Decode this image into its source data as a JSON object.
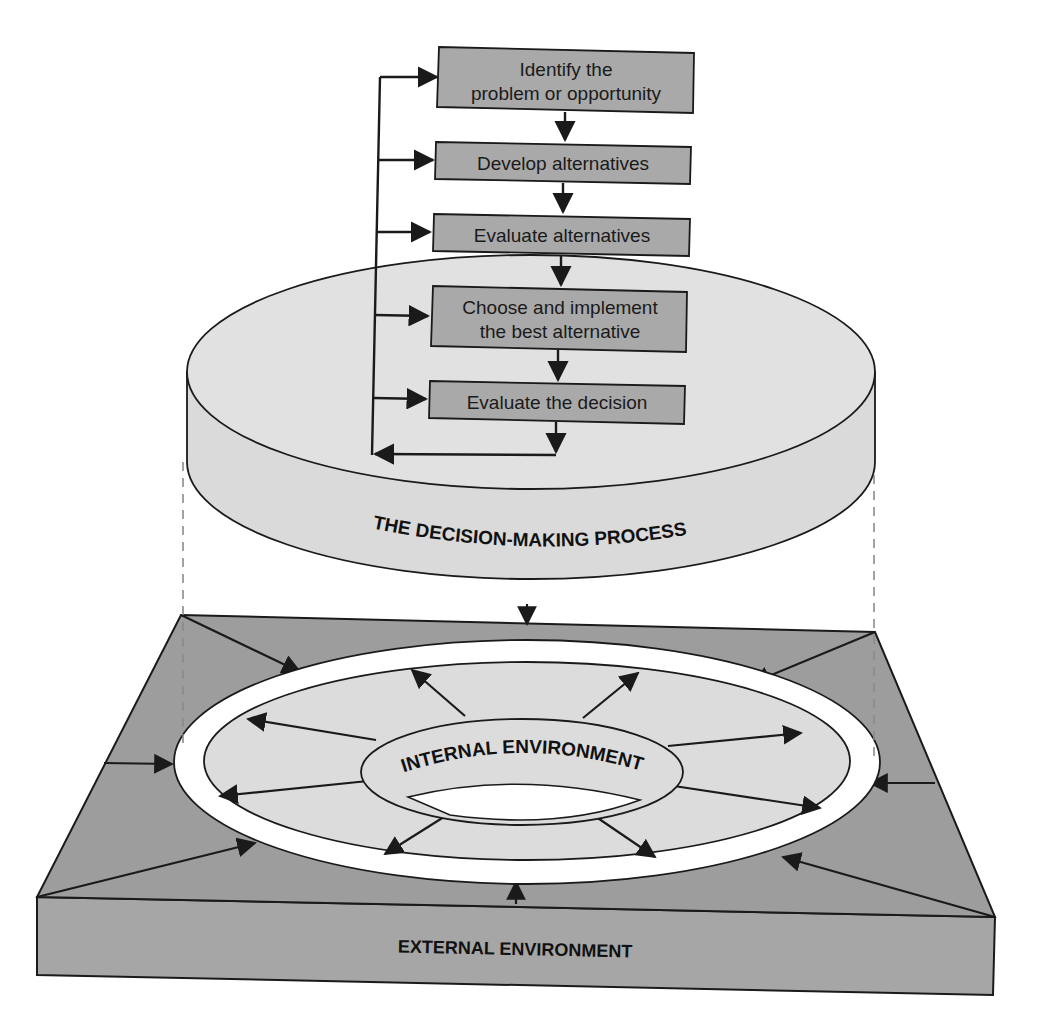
{
  "colors": {
    "box_fill": "#a9a9a9",
    "disc_fill": "#dedede",
    "platform_top": "#9d9d9d",
    "platform_side": "#a6a6a6",
    "inner_ring": "#dcdcdc",
    "stroke": "#1a1a1a"
  },
  "process": {
    "title": "THE DECISION-MAKING PROCESS",
    "steps": [
      {
        "line1": "Identify the",
        "line2": "problem or opportunity"
      },
      {
        "line1": "Develop alternatives",
        "line2": ""
      },
      {
        "line1": "Evaluate alternatives",
        "line2": ""
      },
      {
        "line1": "Choose and implement",
        "line2": "the best alternative"
      },
      {
        "line1": "Evaluate the decision",
        "line2": ""
      }
    ],
    "feedback_loop": "returns to every step"
  },
  "environment": {
    "internal_label": "INTERNAL ENVIRONMENT",
    "external_label": "EXTERNAL ENVIRONMENT",
    "internal_arrows": 8,
    "external_arrows": 8
  }
}
